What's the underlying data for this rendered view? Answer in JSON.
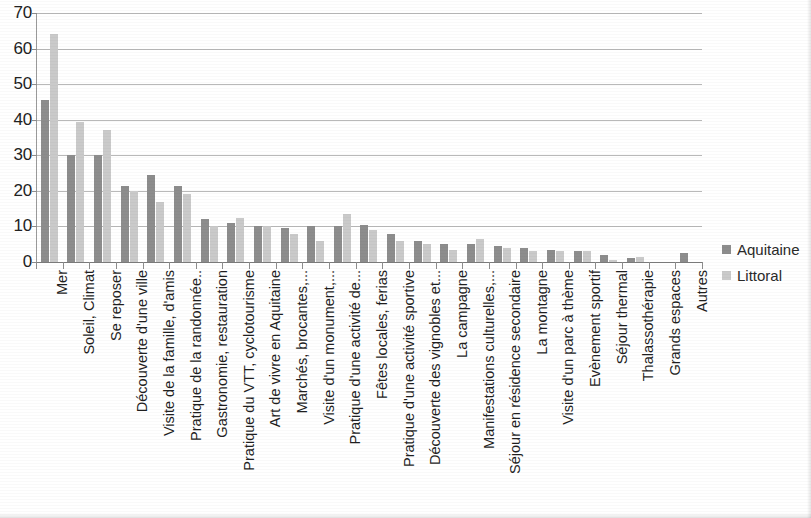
{
  "legend": {
    "position": "right",
    "items": [
      {
        "label": "Aquitaine",
        "color": "#8d8d8d"
      },
      {
        "label": "Littoral",
        "color": "#cacaca"
      }
    ]
  },
  "chart_data": {
    "type": "bar",
    "title": "",
    "subtitle": "",
    "xlabel": "",
    "ylabel": "",
    "ylim": [
      0,
      70
    ],
    "ytick_step": 10,
    "yticks": [
      0,
      10,
      20,
      30,
      40,
      50,
      60,
      70
    ],
    "ytick_labels": [
      "0",
      "10",
      "20",
      "30",
      "40",
      "50",
      "60",
      "70"
    ],
    "grid": true,
    "grid_axis": "y",
    "legend_position": "right",
    "categories": [
      "Mer",
      "Soleil, Climat",
      "Se reposer",
      "Découverte d'une ville",
      "Visite de la famille, d'amis",
      "Pratique de la randonnée..",
      "Gastronomie, restauration",
      "Pratique du VTT, cyclotourisme",
      "Art de vivre en Aquitaine",
      "Marchés, brocantes,...",
      "Visite d'un monument,...",
      "Pratique d'une activité de...",
      "Fêtes locales, ferias",
      "Pratique d'une activité sportive",
      "Découverte des vignobles et...",
      "La campagne",
      "Manifestations culturelles,...",
      "Séjour en résidence secondaire",
      "La montagne",
      "Visite d'un parc à thème",
      "Evènement sportif",
      "Séjour thermal",
      "Thalassothérapie",
      "Grands espaces",
      "Autres"
    ],
    "series": [
      {
        "name": "Aquitaine",
        "color": "#8d8d8d",
        "values": [
          45.5,
          30,
          30,
          21.5,
          24.5,
          21.5,
          12,
          11,
          10,
          9.5,
          10,
          10,
          10.5,
          8,
          6,
          5,
          5,
          4.5,
          4,
          3.5,
          3,
          2,
          1,
          0,
          2.5
        ]
      },
      {
        "name": "Littoral",
        "color": "#cacaca",
        "values": [
          64,
          39.5,
          37,
          20,
          17,
          19,
          10,
          12.5,
          10,
          8,
          6,
          13.5,
          9,
          6,
          5,
          3.5,
          6.5,
          4,
          3,
          3,
          3,
          0.5,
          1.5,
          0,
          0
        ]
      }
    ]
  }
}
